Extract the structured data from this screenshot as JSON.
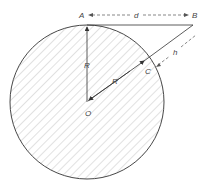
{
  "diagram": {
    "labels": {
      "A": "A",
      "B": "B",
      "C": "C",
      "O": "O",
      "d": "d",
      "h": "h",
      "R_vertical": "R",
      "R_diagonal": "R"
    },
    "colors": {
      "stroke": "#333333",
      "hatch": "#b5b5b5",
      "text": "#444444"
    }
  }
}
